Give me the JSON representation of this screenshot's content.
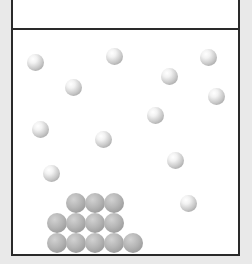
{
  "diagram": {
    "colors": {
      "background": "#e9e9e9",
      "container_fill": "#ffffff",
      "border": "#2a2a2a",
      "free_ball": "#e6e6e6",
      "stacked_ball": "#aaaaaa"
    },
    "free_balls": [
      {
        "x": 35,
        "y": 62
      },
      {
        "x": 114,
        "y": 56
      },
      {
        "x": 73,
        "y": 87
      },
      {
        "x": 208,
        "y": 57
      },
      {
        "x": 169,
        "y": 76
      },
      {
        "x": 216,
        "y": 96
      },
      {
        "x": 155,
        "y": 115
      },
      {
        "x": 40,
        "y": 129
      },
      {
        "x": 103,
        "y": 139
      },
      {
        "x": 51,
        "y": 173
      },
      {
        "x": 175,
        "y": 160
      },
      {
        "x": 188,
        "y": 203
      }
    ],
    "stacked_balls": [
      {
        "x": 76,
        "y": 203
      },
      {
        "x": 95,
        "y": 203
      },
      {
        "x": 114,
        "y": 203
      },
      {
        "x": 57,
        "y": 223
      },
      {
        "x": 76,
        "y": 223
      },
      {
        "x": 95,
        "y": 223
      },
      {
        "x": 114,
        "y": 223
      },
      {
        "x": 57,
        "y": 243
      },
      {
        "x": 76,
        "y": 243
      },
      {
        "x": 95,
        "y": 243
      },
      {
        "x": 114,
        "y": 243
      },
      {
        "x": 133,
        "y": 243
      }
    ]
  }
}
